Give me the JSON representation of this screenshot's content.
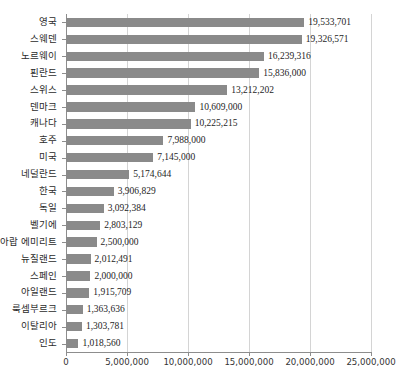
{
  "chart_data": {
    "type": "bar",
    "orientation": "horizontal",
    "title": "",
    "subtitle": "",
    "xlabel": "",
    "ylabel": "",
    "xlim": [
      0,
      25000000
    ],
    "grid": true,
    "legend": null,
    "bar_color": "#8a8a8a",
    "gridline_color": "#d4d4d4",
    "axis_color": "#8d8d8d",
    "background_color": "#ffffff",
    "xticks": [
      0,
      5000000,
      10000000,
      15000000,
      20000000,
      25000000
    ],
    "xtick_labels": [
      "0",
      "5,000,000",
      "10,000,000",
      "15,000,000",
      "20,000,000",
      "25,000,000"
    ],
    "categories": [
      "영국",
      "스웨덴",
      "노르웨이",
      "핀란드",
      "스위스",
      "덴마크",
      "캐나다",
      "호주",
      "미국",
      "네덜란드",
      "한국",
      "독일",
      "벨기에",
      "아랍 에미리트",
      "뉴질랜드",
      "스페인",
      "아일랜드",
      "룩셈부르크",
      "이탈리아",
      "인도"
    ],
    "values": [
      19533701,
      19326571,
      16239316,
      15836000,
      13212202,
      10609000,
      10225215,
      7988000,
      7145000,
      5174644,
      3906829,
      3092384,
      2803129,
      2500000,
      2012491,
      2000000,
      1915709,
      1363636,
      1303781,
      1018560
    ],
    "value_labels": [
      "19,533,701",
      "19,326,571",
      "16,239,316",
      "15,836,000",
      "13,212,202",
      "10,609,000",
      "10,225,215",
      "7,988,000",
      "7,145,000",
      "5,174,644",
      "3,906,829",
      "3,092,384",
      "2,803,129",
      "2,500,000",
      "2,012,491",
      "2,000,000",
      "1,915,709",
      "1,363,636",
      "1,303,781",
      "1,018,560"
    ]
  }
}
